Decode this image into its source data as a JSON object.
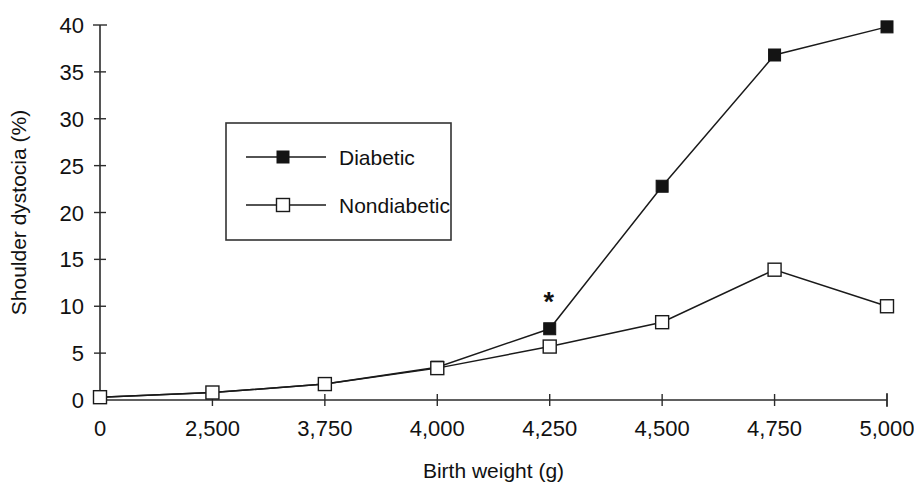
{
  "chart_data": {
    "type": "line",
    "title": "",
    "xlabel": "Birth weight (g)",
    "ylabel": "Shoulder dystocia (%)",
    "categories": [
      "0",
      "2,500",
      "3,750",
      "4,000",
      "4,250",
      "4,500",
      "4,750",
      "5,000"
    ],
    "ylim": [
      0,
      40
    ],
    "yticks": [
      "0",
      "5",
      "10",
      "15",
      "20",
      "25",
      "30",
      "35",
      "40"
    ],
    "ytick_values": [
      0,
      5,
      10,
      15,
      20,
      25,
      30,
      35,
      40
    ],
    "grid": false,
    "legend_position": "upper-left-inside",
    "series": [
      {
        "name": "Diabetic",
        "marker": "filled-square",
        "values": [
          0.3,
          0.8,
          1.7,
          3.5,
          7.6,
          22.8,
          36.8,
          39.8
        ]
      },
      {
        "name": "Nondiabetic",
        "marker": "open-square",
        "values": [
          0.3,
          0.8,
          1.7,
          3.4,
          5.7,
          8.3,
          13.9,
          10.0
        ]
      }
    ],
    "annotations": [
      {
        "text": "*",
        "category": "4,250",
        "series": "Diabetic",
        "value": 7.6
      }
    ]
  },
  "legend": {
    "items": [
      {
        "label": "Diabetic"
      },
      {
        "label": "Nondiabetic"
      }
    ]
  },
  "colors": {
    "line": "#1a1a1a",
    "axis": "#2b2b2b",
    "text": "#111111",
    "background": "#ffffff"
  }
}
